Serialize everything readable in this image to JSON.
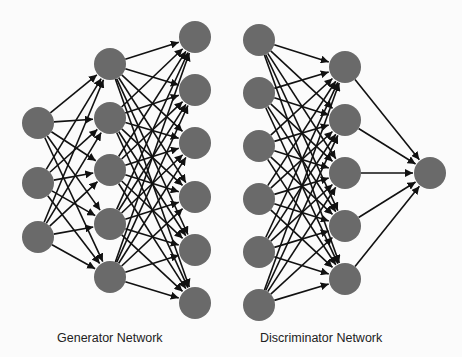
{
  "diagram": {
    "node_color": "#6a6a6a",
    "edge_color": "#111111",
    "node_radius": 16,
    "networks": [
      {
        "name": "generator",
        "label": "Generator Network",
        "label_x": 57,
        "layers": [
          {
            "x": 38,
            "ys": [
              123,
              183,
              237
            ]
          },
          {
            "x": 110,
            "ys": [
              64,
              118,
              170,
              224,
              277
            ]
          },
          {
            "x": 195,
            "ys": [
              37,
              90,
              143,
              197,
              250,
              303
            ]
          }
        ]
      },
      {
        "name": "discriminator",
        "label": "Discriminator Network",
        "label_x": 260,
        "layers": [
          {
            "x": 259,
            "ys": [
              40,
              93,
              146,
              199,
              252,
              305
            ]
          },
          {
            "x": 345,
            "ys": [
              67,
              120,
              173,
              226,
              279
            ]
          },
          {
            "x": 430,
            "ys": [
              173
            ]
          }
        ]
      }
    ]
  }
}
